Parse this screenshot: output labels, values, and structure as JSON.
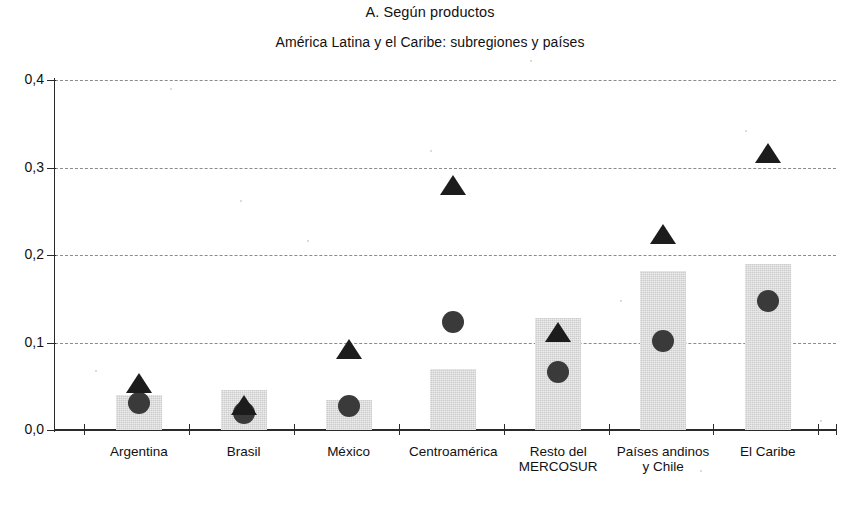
{
  "titles": {
    "main": "A. Según productos",
    "sub": "América Latina y el Caribe: subregiones y países"
  },
  "colors": {
    "bar_fill": "#d4d4d4",
    "circle_marker": "#3a3a3a",
    "triangle_marker": "#1c1c1c",
    "gridline": "#8b8b8b",
    "axis": "#2a2a2a",
    "background": "#ffffff"
  },
  "chart_data": {
    "type": "bar",
    "title": "A. Según productos",
    "subtitle": "América Latina y el Caribe: subregiones y países",
    "xlabel": "",
    "ylabel": "",
    "ylim": [
      0.0,
      0.4
    ],
    "yticks": [
      0.0,
      0.1,
      0.2,
      0.3,
      0.4
    ],
    "ytick_labels": [
      "0,0",
      "0,1",
      "0,2",
      "0,3",
      "0,4"
    ],
    "grid": true,
    "legend": null,
    "categories": [
      "Argentina",
      "Brasil",
      "México",
      "Centroamérica",
      "Resto del\nMERCOSUR",
      "Países andinos\ny Chile",
      "El Caribe"
    ],
    "series": [
      {
        "name": "bars",
        "marker": "bar",
        "values": [
          0.04,
          0.046,
          0.034,
          0.07,
          0.128,
          0.182,
          0.19
        ]
      },
      {
        "name": "circles",
        "marker": "circle",
        "values": [
          0.031,
          0.02,
          0.027,
          0.124,
          0.066,
          0.102,
          0.148
        ]
      },
      {
        "name": "triangles",
        "marker": "triangle",
        "values": [
          0.052,
          0.027,
          0.091,
          0.278,
          0.11,
          0.222,
          0.315
        ]
      }
    ]
  }
}
